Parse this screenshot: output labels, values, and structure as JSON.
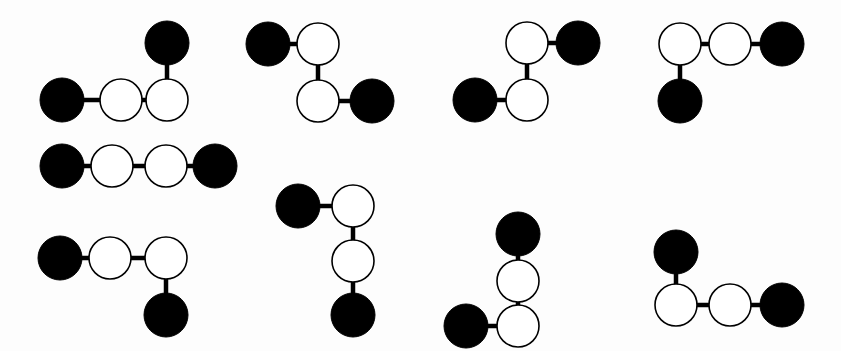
{
  "figure": {
    "background_color": "#fdfdfd",
    "width": 841,
    "height": 351,
    "node_colors": {
      "filled": "#000000",
      "open": "#ffffff",
      "outline": "#000000"
    },
    "edge_color": "#000000",
    "node_radius_filled": 22,
    "node_radius_open": 21,
    "edge_width": 4.5
  },
  "chart_data": {
    "type": "diagram",
    "node_types": [
      "filled",
      "open"
    ],
    "graph_count": 9,
    "graphs": [
      {
        "id": "graph-1",
        "label": "row1-col1",
        "shape": "elbow-up-right",
        "nodes": [
          {
            "id": "g1n1",
            "type": "filled",
            "x": 62,
            "y": 100
          },
          {
            "id": "g1n2",
            "type": "open",
            "x": 121,
            "y": 100
          },
          {
            "id": "g1n3",
            "type": "open",
            "x": 167,
            "y": 100
          },
          {
            "id": "g1n4",
            "type": "filled",
            "x": 167,
            "y": 43
          }
        ],
        "edges": [
          [
            "g1n1",
            "g1n2"
          ],
          [
            "g1n2",
            "g1n3"
          ],
          [
            "g1n3",
            "g1n4"
          ]
        ]
      },
      {
        "id": "graph-2",
        "label": "row1-col2",
        "shape": "zigzag",
        "nodes": [
          {
            "id": "g2n1",
            "type": "filled",
            "x": 268,
            "y": 44
          },
          {
            "id": "g2n2",
            "type": "open",
            "x": 318,
            "y": 44
          },
          {
            "id": "g2n3",
            "type": "open",
            "x": 318,
            "y": 101
          },
          {
            "id": "g2n4",
            "type": "filled",
            "x": 372,
            "y": 101
          }
        ],
        "edges": [
          [
            "g2n1",
            "g2n2"
          ],
          [
            "g2n2",
            "g2n3"
          ],
          [
            "g2n3",
            "g2n4"
          ]
        ]
      },
      {
        "id": "graph-3",
        "label": "row1-col3",
        "shape": "zigzag-mirror",
        "nodes": [
          {
            "id": "g3n1",
            "type": "filled",
            "x": 578,
            "y": 43
          },
          {
            "id": "g3n2",
            "type": "open",
            "x": 527,
            "y": 43
          },
          {
            "id": "g3n3",
            "type": "open",
            "x": 527,
            "y": 100
          },
          {
            "id": "g3n4",
            "type": "filled",
            "x": 475,
            "y": 100
          }
        ],
        "edges": [
          [
            "g3n1",
            "g3n2"
          ],
          [
            "g3n2",
            "g3n3"
          ],
          [
            "g3n3",
            "g3n4"
          ]
        ]
      },
      {
        "id": "graph-4",
        "label": "row1-col4",
        "shape": "elbow-down-left",
        "nodes": [
          {
            "id": "g4n1",
            "type": "filled",
            "x": 680,
            "y": 101
          },
          {
            "id": "g4n2",
            "type": "open",
            "x": 680,
            "y": 44
          },
          {
            "id": "g4n3",
            "type": "open",
            "x": 730,
            "y": 44
          },
          {
            "id": "g4n4",
            "type": "filled",
            "x": 782,
            "y": 44
          }
        ],
        "edges": [
          [
            "g4n1",
            "g4n2"
          ],
          [
            "g4n2",
            "g4n3"
          ],
          [
            "g4n3",
            "g4n4"
          ]
        ]
      },
      {
        "id": "graph-5",
        "label": "row2-col1",
        "shape": "straight-horizontal",
        "nodes": [
          {
            "id": "g5n1",
            "type": "filled",
            "x": 62,
            "y": 166
          },
          {
            "id": "g5n2",
            "type": "open",
            "x": 112,
            "y": 166
          },
          {
            "id": "g5n3",
            "type": "open",
            "x": 166,
            "y": 166
          },
          {
            "id": "g5n4",
            "type": "filled",
            "x": 215,
            "y": 166
          }
        ],
        "edges": [
          [
            "g5n1",
            "g5n2"
          ],
          [
            "g5n2",
            "g5n3"
          ],
          [
            "g5n3",
            "g5n4"
          ]
        ]
      },
      {
        "id": "graph-6",
        "label": "row3-col1",
        "shape": "elbow-down-right",
        "nodes": [
          {
            "id": "g6n1",
            "type": "filled",
            "x": 60,
            "y": 258
          },
          {
            "id": "g6n2",
            "type": "open",
            "x": 110,
            "y": 258
          },
          {
            "id": "g6n3",
            "type": "open",
            "x": 166,
            "y": 258
          },
          {
            "id": "g6n4",
            "type": "filled",
            "x": 166,
            "y": 315
          }
        ],
        "edges": [
          [
            "g6n1",
            "g6n2"
          ],
          [
            "g6n2",
            "g6n3"
          ],
          [
            "g6n3",
            "g6n4"
          ]
        ]
      },
      {
        "id": "graph-7",
        "label": "row3-col2",
        "shape": "vertical-with-left-branch",
        "nodes": [
          {
            "id": "g7n1",
            "type": "filled",
            "x": 298,
            "y": 206
          },
          {
            "id": "g7n2",
            "type": "open",
            "x": 353,
            "y": 206
          },
          {
            "id": "g7n3",
            "type": "open",
            "x": 353,
            "y": 261
          },
          {
            "id": "g7n4",
            "type": "filled",
            "x": 353,
            "y": 315
          }
        ],
        "edges": [
          [
            "g7n1",
            "g7n2"
          ],
          [
            "g7n2",
            "g7n3"
          ],
          [
            "g7n3",
            "g7n4"
          ]
        ]
      },
      {
        "id": "graph-8",
        "label": "row3-col3",
        "shape": "vertical-with-bottom-left-branch",
        "nodes": [
          {
            "id": "g8n1",
            "type": "filled",
            "x": 518,
            "y": 234
          },
          {
            "id": "g8n2",
            "type": "open",
            "x": 518,
            "y": 281
          },
          {
            "id": "g8n3",
            "type": "open",
            "x": 518,
            "y": 326
          },
          {
            "id": "g8n4",
            "type": "filled",
            "x": 466,
            "y": 326
          }
        ],
        "edges": [
          [
            "g8n1",
            "g8n2"
          ],
          [
            "g8n2",
            "g8n3"
          ],
          [
            "g8n3",
            "g8n4"
          ]
        ]
      },
      {
        "id": "graph-9",
        "label": "row3-col4",
        "shape": "elbow-up-left",
        "nodes": [
          {
            "id": "g9n1",
            "type": "filled",
            "x": 676,
            "y": 252
          },
          {
            "id": "g9n2",
            "type": "open",
            "x": 676,
            "y": 305
          },
          {
            "id": "g9n3",
            "type": "open",
            "x": 730,
            "y": 305
          },
          {
            "id": "g9n4",
            "type": "filled",
            "x": 782,
            "y": 305
          }
        ],
        "edges": [
          [
            "g9n1",
            "g9n2"
          ],
          [
            "g9n2",
            "g9n3"
          ],
          [
            "g9n3",
            "g9n4"
          ]
        ]
      }
    ]
  }
}
